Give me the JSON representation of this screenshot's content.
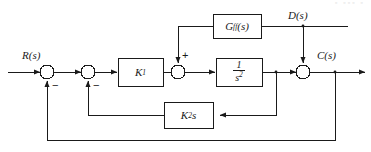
{
  "diagram": {
    "type": "block-diagram",
    "stroke_color": "#1a1a1a",
    "background_color": "#ffffff",
    "signals": {
      "input": "R(s)",
      "disturbance": "D(s)",
      "output": "C(s)"
    },
    "blocks": [
      {
        "id": "gff",
        "label_main": "G",
        "label_sub": "ff",
        "label_tail": "(s)",
        "name": "feedforward-block"
      },
      {
        "id": "k1",
        "label_main": "K",
        "label_sub": "1",
        "label_tail": "",
        "name": "gain-k1-block"
      },
      {
        "id": "plant",
        "label_num": "1",
        "label_den_main": "s",
        "label_den_sup": "2",
        "name": "plant-block"
      },
      {
        "id": "k2s",
        "label_main": "K",
        "label_sub": "2",
        "label_tail": "s",
        "name": "rate-feedback-block"
      }
    ],
    "summing_junctions": [
      {
        "id": "sum1",
        "sign": "−",
        "sign_position": "below-right",
        "name": "outer-loop-summing-junction"
      },
      {
        "id": "sum2",
        "sign": "−",
        "sign_position": "below-right",
        "name": "inner-loop-summing-junction"
      },
      {
        "id": "sum3",
        "sign": "+",
        "sign_position": "above-right",
        "name": "feedforward-summing-junction"
      },
      {
        "id": "sum4",
        "sign": "",
        "sign_position": "none",
        "name": "disturbance-summing-junction"
      }
    ]
  }
}
